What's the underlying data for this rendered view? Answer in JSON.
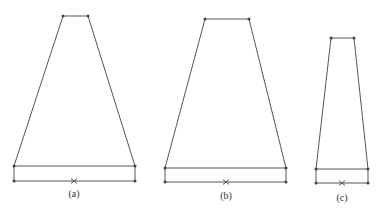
{
  "figures": [
    {
      "id": "a",
      "label": "(a)",
      "top_left": [
        63,
        16
      ],
      "top_right": [
        88,
        16
      ],
      "base_left": [
        14,
        166
      ],
      "base_right": [
        135,
        166
      ],
      "bottom_y": 181,
      "cross": [
        74,
        181
      ],
      "label_pos": [
        74,
        188
      ]
    },
    {
      "id": "b",
      "label": "(b)",
      "top_left": [
        205,
        19
      ],
      "top_right": [
        249,
        19
      ],
      "base_left": [
        165,
        168
      ],
      "base_right": [
        286,
        168
      ],
      "bottom_y": 182,
      "cross": [
        226,
        182
      ],
      "label_pos": [
        226,
        190
      ]
    },
    {
      "id": "c",
      "label": "(c)",
      "top_left": [
        331,
        38
      ],
      "top_right": [
        354,
        38
      ],
      "base_left": [
        316,
        169
      ],
      "base_right": [
        368,
        169
      ],
      "bottom_y": 183,
      "cross": [
        342,
        183
      ],
      "label_pos": [
        342,
        192
      ]
    }
  ],
  "colors": {
    "stroke": "#555555",
    "point": "#444444"
  }
}
